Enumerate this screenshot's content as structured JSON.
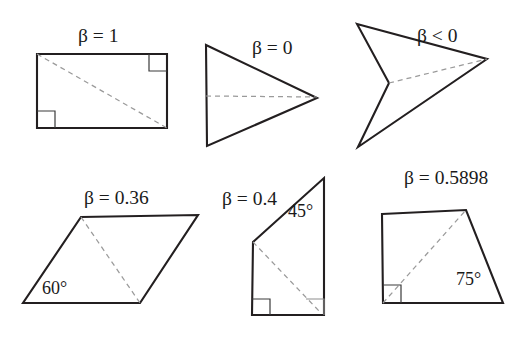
{
  "figure": {
    "width": 523,
    "height": 337,
    "background_color": "#ffffff",
    "outline_color": "#231f20",
    "diagonal_color": "#9a9a9a"
  },
  "shapes": [
    {
      "id": "rectangle",
      "name": "rectangle",
      "beta_label": "β = 1",
      "beta_label_x": 78,
      "beta_label_y": 26,
      "points": "37,54 167,54 167,128 37,128",
      "diagonal": "37,54 167,128",
      "angle_label": "",
      "angle_label_x": 0,
      "angle_label_y": 0
    },
    {
      "id": "triangle",
      "name": "triangle",
      "beta_label": "β = 0",
      "beta_label_x": 252,
      "beta_label_y": 38,
      "points": "206,45 317,98 207,146",
      "diagonal": "206,96 317,97",
      "angle_label": "",
      "angle_label_x": 0,
      "angle_label_y": 0
    },
    {
      "id": "dart",
      "name": "dart-arrow",
      "beta_label": "β < 0",
      "beta_label_x": 417,
      "beta_label_y": 26,
      "points": "357,24 487,59 358,147 389,83",
      "diagonal": "389,83 487,59",
      "angle_label": "",
      "angle_label_x": 0,
      "angle_label_y": 0
    },
    {
      "id": "parallelogram",
      "name": "parallelogram",
      "beta_label": "β = 0.36",
      "beta_label_x": 84,
      "beta_label_y": 188,
      "points": "81,217 198,215 140,303 23,303",
      "diagonal": "81,217 140,303",
      "angle_label": "60°",
      "angle_label_x": 42,
      "angle_label_y": 279
    },
    {
      "id": "right-quad",
      "name": "right-trapezoid",
      "beta_label": "β = 0.4",
      "beta_label_x": 222,
      "beta_label_y": 189,
      "points": "324,178 324,315 252,315 253,242",
      "diagonal": "253,242 320,312",
      "angle_label": "45°",
      "angle_label_x": 288,
      "angle_label_y": 202
    },
    {
      "id": "slanted-quad",
      "name": "slanted-quadrilateral",
      "beta_label": "β = 0.5898",
      "beta_label_x": 404,
      "beta_label_y": 168,
      "points": "382,214 466,210 503,303 383,303",
      "diagonal": "383,303 466,210",
      "angle_label": "75°",
      "angle_label_x": 456,
      "angle_label_y": 270
    }
  ]
}
